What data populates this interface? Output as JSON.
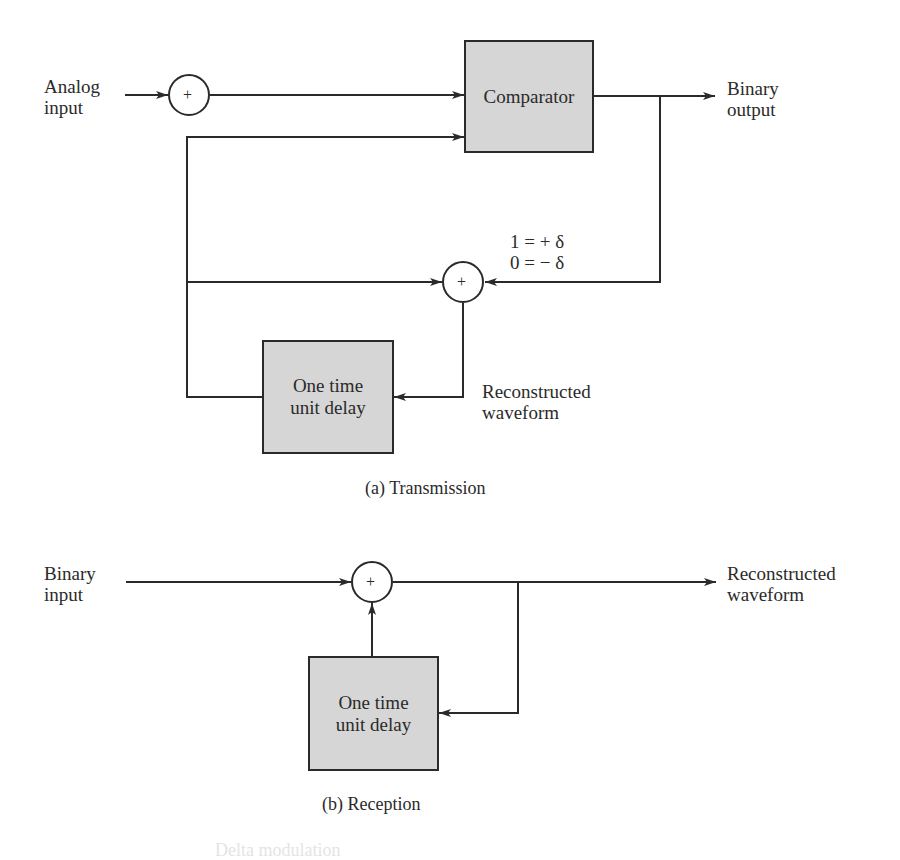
{
  "transmission": {
    "caption": "(a) Transmission",
    "analog_input_label": [
      "Analog",
      "input"
    ],
    "binary_output_label": [
      "Binary",
      "output"
    ],
    "comparator_label": "Comparator",
    "delay_label": [
      "One time",
      "unit delay"
    ],
    "quantize_rule": [
      "1 = + δ",
      "0 = − δ"
    ],
    "reconstructed_label": [
      "Reconstructed",
      "waveform"
    ],
    "adder_symbol": "+"
  },
  "reception": {
    "caption": "(b) Reception",
    "binary_input_label": [
      "Binary",
      "input"
    ],
    "reconstructed_label": [
      "Reconstructed",
      "waveform"
    ],
    "delay_label": [
      "One time",
      "unit delay"
    ],
    "adder_symbol": "+"
  },
  "figure_caption_partial": "Delta modulation",
  "colors": {
    "line": "#2a2a2a",
    "block_fill": "#d6d6d6",
    "background": "#ffffff"
  }
}
